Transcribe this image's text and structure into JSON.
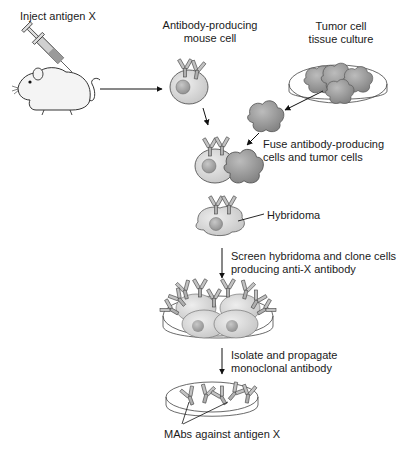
{
  "diagram": {
    "labels": {
      "inject": "Inject antigen X",
      "antibody_cell_line1": "Antibody-producing",
      "antibody_cell_line2": "mouse cell",
      "tumor_line1": "Tumor cell",
      "tumor_line2": "tissue culture",
      "fuse_line1": "Fuse antibody-producing",
      "fuse_line2": "cells and tumor cells",
      "hybridoma": "Hybridoma",
      "screen_line1": "Screen hybridoma and clone cells",
      "screen_line2": "producing anti-X antibody",
      "isolate_line1": "Isolate and propagate",
      "isolate_line2": "monoclonal antibody",
      "mabs": "MAbs against antigen X"
    },
    "steps": [
      {
        "id": "inject",
        "from": "mouse",
        "to": "antibody-producing-cell"
      },
      {
        "id": "fuse",
        "from": [
          "antibody-producing-cell",
          "tumor-cell"
        ],
        "to": "fused-cells"
      },
      {
        "id": "hybridoma",
        "from": "fused-cells",
        "to": "hybridoma"
      },
      {
        "id": "screen",
        "from": "hybridoma",
        "to": "cloned-culture"
      },
      {
        "id": "isolate",
        "from": "cloned-culture",
        "to": "mab-dish"
      }
    ],
    "colors": {
      "stroke": "#333333",
      "cell_fill": "#d6d6d6",
      "nucleus_fill": "#a8a8a8",
      "tumor_fill": "#9a9a9a",
      "antibody_fill": "#b5b5b5",
      "mouse_fill": "#f2f2f2"
    }
  }
}
